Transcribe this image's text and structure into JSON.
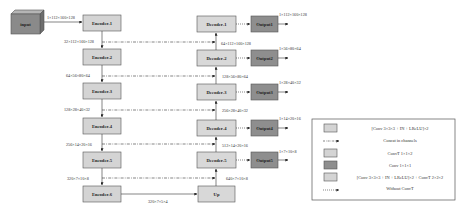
{
  "input": {
    "label": "input",
    "dims": "1×112×160×128"
  },
  "encoders": [
    {
      "label": "Encoder-1",
      "out_dims": "32×112×160×128"
    },
    {
      "label": "Encoder-2",
      "out_dims": "64×56×80×64"
    },
    {
      "label": "Encoder-3",
      "out_dims": "128×28×40×32"
    },
    {
      "label": "Encoder-4",
      "out_dims": "256×14×20×16"
    },
    {
      "label": "Encoder-5",
      "out_dims": "320×7×10×8"
    },
    {
      "label": "Encoder-6",
      "out_dims": "320×7×5×4"
    }
  ],
  "decoders": [
    {
      "label": "Decoder-1",
      "in_dims": "64×112×160×128"
    },
    {
      "label": "Decoder-2",
      "in_dims": "128×56×80×64"
    },
    {
      "label": "Decoder-3",
      "in_dims": "256×28×40×32"
    },
    {
      "label": "Decoder-4",
      "in_dims": "512×14×20×16"
    },
    {
      "label": "Decoder-5",
      "in_dims": "640×7×10×8"
    }
  ],
  "up": {
    "label": "Up"
  },
  "outputs": [
    {
      "label": "Output1",
      "dims": "1×112×160×128"
    },
    {
      "label": "Output2",
      "dims": "1×56×80×64"
    },
    {
      "label": "Output3",
      "dims": "1×28×40×32"
    },
    {
      "label": "Output4",
      "dims": "1×14×20×16"
    },
    {
      "label": "Output5",
      "dims": "1×7×10×8"
    }
  ],
  "legend": {
    "items": [
      {
        "symbol": "box-light",
        "label": "[Conv 3×3×3 + IN + LReLU]×2"
      },
      {
        "symbol": "dash-dot-arrow",
        "label": "Concat in channels"
      },
      {
        "symbol": "box-light",
        "label": "ConvT 1×1×2"
      },
      {
        "symbol": "box-dark",
        "label": "Conv 1×1×1"
      },
      {
        "symbol": "box-light",
        "label": "[Conv 3×3×3 + IN + LReLU]×2 + ConvT 2×2×2"
      },
      {
        "symbol": "dotted-arrow",
        "label": "Without ConvT"
      }
    ]
  },
  "colors": {
    "encoder_fill": "#d4d4d4",
    "decoder_fill": "#d8d8d8",
    "output_fill": "#8e8e8e",
    "input_fill": "#8a8a8a",
    "stroke": "#555555",
    "line": "#333333"
  }
}
